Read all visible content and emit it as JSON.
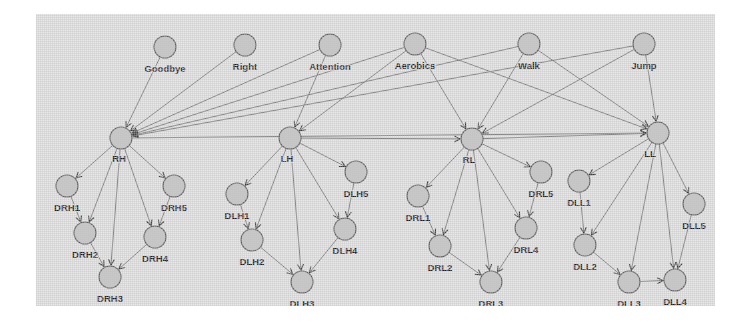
{
  "figure": {
    "kind": "directed-graph",
    "panel": {
      "background_color": "#e8e8e8",
      "page_background_color": "#ffffff"
    },
    "style": {
      "node_fill_color": "#c9c9c9",
      "node_stroke_color": "#5c5c5c",
      "edge_color": "#6f6f6f",
      "label_color": "#1c1c1c",
      "node_radius": 11
    },
    "layers": [
      {
        "name": "behaviors",
        "labels": [
          "Goodbye",
          "Right",
          "Attention",
          "Aerobics",
          "Walk",
          "Jump"
        ]
      },
      {
        "name": "limbs",
        "labels": [
          "RH",
          "LH",
          "RL",
          "LL"
        ]
      },
      {
        "name": "joints-right-hand",
        "labels": [
          "DRH1",
          "DRH2",
          "DRH3",
          "DRH4",
          "DRH5"
        ]
      },
      {
        "name": "joints-left-hand",
        "labels": [
          "DLH1",
          "DLH2",
          "DLH3",
          "DLH4",
          "DLH5"
        ]
      },
      {
        "name": "joints-right-leg",
        "labels": [
          "DRL1",
          "DRL2",
          "DRL3",
          "DRL4",
          "DRL5"
        ]
      },
      {
        "name": "joints-left-leg",
        "labels": [
          "DLL1",
          "DLL2",
          "DLL3",
          "DLL4",
          "DLL5"
        ]
      }
    ],
    "nodes": [
      {
        "id": "Goodbye",
        "label": "Goodbye",
        "x": 129,
        "y": 33,
        "label_dx": 0,
        "label_dy": 22
      },
      {
        "id": "Right",
        "label": "Right",
        "x": 209,
        "y": 31,
        "label_dx": 0,
        "label_dy": 22
      },
      {
        "id": "Attention",
        "label": "Attention",
        "x": 294,
        "y": 31,
        "label_dx": 0,
        "label_dy": 22
      },
      {
        "id": "Aerobics",
        "label": "Aerobics",
        "x": 379,
        "y": 30,
        "label_dx": 0,
        "label_dy": 22
      },
      {
        "id": "Walk",
        "label": "Walk",
        "x": 493,
        "y": 30,
        "label_dx": 0,
        "label_dy": 22
      },
      {
        "id": "Jump",
        "label": "Jump",
        "x": 608,
        "y": 30,
        "label_dx": 0,
        "label_dy": 22
      },
      {
        "id": "RH",
        "label": "RH",
        "x": 85,
        "y": 124,
        "label_dx": -2,
        "label_dy": 21
      },
      {
        "id": "LH",
        "label": "LH",
        "x": 254,
        "y": 124,
        "label_dx": -3,
        "label_dy": 21
      },
      {
        "id": "RL",
        "label": "RL",
        "x": 436,
        "y": 125,
        "label_dx": -3,
        "label_dy": 21
      },
      {
        "id": "LL",
        "label": "LL",
        "x": 622,
        "y": 119,
        "label_dx": -8,
        "label_dy": 21
      },
      {
        "id": "DRH1",
        "label": "DRH1",
        "x": 31,
        "y": 172,
        "label_dx": 0,
        "label_dy": 22
      },
      {
        "id": "DRH2",
        "label": "DRH2",
        "x": 49,
        "y": 219,
        "label_dx": 0,
        "label_dy": 22
      },
      {
        "id": "DRH3",
        "label": "DRH3",
        "x": 74,
        "y": 263,
        "label_dx": 0,
        "label_dy": 22
      },
      {
        "id": "DRH4",
        "label": "DRH4",
        "x": 119,
        "y": 223,
        "label_dx": 0,
        "label_dy": 22
      },
      {
        "id": "DRH5",
        "label": "DRH5",
        "x": 138,
        "y": 172,
        "label_dx": 0,
        "label_dy": 22
      },
      {
        "id": "DLH1",
        "label": "DLH1",
        "x": 201,
        "y": 180,
        "label_dx": 0,
        "label_dy": 22
      },
      {
        "id": "DLH2",
        "label": "DLH2",
        "x": 216,
        "y": 226,
        "label_dx": 0,
        "label_dy": 22
      },
      {
        "id": "DLH3",
        "label": "DLH3",
        "x": 266,
        "y": 268,
        "label_dx": 0,
        "label_dy": 22
      },
      {
        "id": "DLH4",
        "label": "DLH4",
        "x": 309,
        "y": 215,
        "label_dx": 0,
        "label_dy": 22
      },
      {
        "id": "DLH5",
        "label": "DLH5",
        "x": 320,
        "y": 158,
        "label_dx": 0,
        "label_dy": 22
      },
      {
        "id": "DRL1",
        "label": "DRL1",
        "x": 382,
        "y": 182,
        "label_dx": 0,
        "label_dy": 22
      },
      {
        "id": "DRL2",
        "label": "DRL2",
        "x": 404,
        "y": 232,
        "label_dx": 0,
        "label_dy": 22
      },
      {
        "id": "DRL3",
        "label": "DRL3",
        "x": 455,
        "y": 268,
        "label_dx": 0,
        "label_dy": 22
      },
      {
        "id": "DRL4",
        "label": "DRL4",
        "x": 490,
        "y": 214,
        "label_dx": 0,
        "label_dy": 22
      },
      {
        "id": "DRL5",
        "label": "DRL5",
        "x": 505,
        "y": 158,
        "label_dx": 0,
        "label_dy": 22
      },
      {
        "id": "DLL1",
        "label": "DLL1",
        "x": 543,
        "y": 167,
        "label_dx": 0,
        "label_dy": 22
      },
      {
        "id": "DLL2",
        "label": "DLL2",
        "x": 549,
        "y": 231,
        "label_dx": 0,
        "label_dy": 22
      },
      {
        "id": "DLL3",
        "label": "DLL3",
        "x": 593,
        "y": 268,
        "label_dx": 0,
        "label_dy": 22
      },
      {
        "id": "DLL4",
        "label": "DLL4",
        "x": 639,
        "y": 266,
        "label_dx": 0,
        "label_dy": 22
      },
      {
        "id": "DLL5",
        "label": "DLL5",
        "x": 658,
        "y": 190,
        "label_dx": 0,
        "label_dy": 22
      }
    ],
    "edges": [
      {
        "from": "Goodbye",
        "to": "RH"
      },
      {
        "from": "Right",
        "to": "RH"
      },
      {
        "from": "Attention",
        "to": "RH"
      },
      {
        "from": "Attention",
        "to": "LH"
      },
      {
        "from": "Aerobics",
        "to": "RH"
      },
      {
        "from": "Aerobics",
        "to": "LH"
      },
      {
        "from": "Aerobics",
        "to": "RL"
      },
      {
        "from": "Aerobics",
        "to": "LL"
      },
      {
        "from": "Walk",
        "to": "RL"
      },
      {
        "from": "Walk",
        "to": "LL"
      },
      {
        "from": "Jump",
        "to": "RL"
      },
      {
        "from": "Jump",
        "to": "LL"
      },
      {
        "from": "Walk",
        "to": "RH"
      },
      {
        "from": "Jump",
        "to": "RH"
      },
      {
        "from": "RH",
        "to": "LL"
      },
      {
        "from": "RL",
        "to": "LL"
      },
      {
        "from": "LH",
        "to": "RL"
      },
      {
        "from": "RH",
        "to": "DRH1"
      },
      {
        "from": "RH",
        "to": "DRH2"
      },
      {
        "from": "RH",
        "to": "DRH3"
      },
      {
        "from": "RH",
        "to": "DRH4"
      },
      {
        "from": "RH",
        "to": "DRH5"
      },
      {
        "from": "DRH1",
        "to": "DRH2"
      },
      {
        "from": "DRH2",
        "to": "DRH3"
      },
      {
        "from": "DRH5",
        "to": "DRH4"
      },
      {
        "from": "DRH4",
        "to": "DRH3"
      },
      {
        "from": "LH",
        "to": "DLH1"
      },
      {
        "from": "LH",
        "to": "DLH2"
      },
      {
        "from": "LH",
        "to": "DLH3"
      },
      {
        "from": "LH",
        "to": "DLH4"
      },
      {
        "from": "LH",
        "to": "DLH5"
      },
      {
        "from": "DLH1",
        "to": "DLH2"
      },
      {
        "from": "DLH2",
        "to": "DLH3"
      },
      {
        "from": "DLH5",
        "to": "DLH4"
      },
      {
        "from": "DLH4",
        "to": "DLH3"
      },
      {
        "from": "RL",
        "to": "DRL1"
      },
      {
        "from": "RL",
        "to": "DRL2"
      },
      {
        "from": "RL",
        "to": "DRL3"
      },
      {
        "from": "RL",
        "to": "DRL4"
      },
      {
        "from": "RL",
        "to": "DRL5"
      },
      {
        "from": "DRL1",
        "to": "DRL2"
      },
      {
        "from": "DRL2",
        "to": "DRL3"
      },
      {
        "from": "DRL5",
        "to": "DRL4"
      },
      {
        "from": "DRL4",
        "to": "DRL3"
      },
      {
        "from": "LL",
        "to": "DLL1"
      },
      {
        "from": "LL",
        "to": "DLL2"
      },
      {
        "from": "LL",
        "to": "DLL3"
      },
      {
        "from": "LL",
        "to": "DLL4"
      },
      {
        "from": "LL",
        "to": "DLL5"
      },
      {
        "from": "DLL1",
        "to": "DLL2"
      },
      {
        "from": "DLL2",
        "to": "DLL3"
      },
      {
        "from": "DLL5",
        "to": "DLL4"
      },
      {
        "from": "DLL3",
        "to": "DLL4"
      }
    ]
  }
}
